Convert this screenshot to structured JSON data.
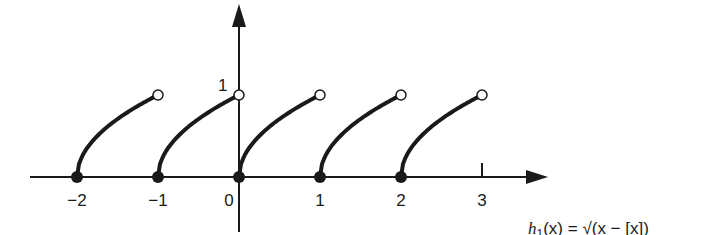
{
  "chart_data": {
    "type": "line",
    "title": "",
    "xlabel": "",
    "ylabel": "",
    "caption": "h1(x) = √(x − [x])",
    "x_ticks": [
      "-2",
      "-1",
      "0",
      "1",
      "2",
      "3"
    ],
    "y_ticks": [
      "1"
    ],
    "xlim": [
      -2.5,
      3.8
    ],
    "ylim": [
      -0.7,
      2.1
    ],
    "grid": false,
    "legend": "none",
    "series": [
      {
        "name": "segment [-2,-1)",
        "x": [
          -2,
          -1.75,
          -1.5,
          -1.25,
          -1
        ],
        "y": [
          0,
          0.5,
          0.707,
          0.866,
          1
        ],
        "start": "closed",
        "end": "open"
      },
      {
        "name": "segment [-1,0)",
        "x": [
          -1,
          -0.75,
          -0.5,
          -0.25,
          0
        ],
        "y": [
          0,
          0.5,
          0.707,
          0.866,
          1
        ],
        "start": "closed",
        "end": "open"
      },
      {
        "name": "segment [0,1)",
        "x": [
          0,
          0.25,
          0.5,
          0.75,
          1
        ],
        "y": [
          0,
          0.5,
          0.707,
          0.866,
          1
        ],
        "start": "closed",
        "end": "open"
      },
      {
        "name": "segment [1,2)",
        "x": [
          1,
          1.25,
          1.5,
          1.75,
          2
        ],
        "y": [
          0,
          0.5,
          0.707,
          0.866,
          1
        ],
        "start": "closed",
        "end": "open"
      },
      {
        "name": "segment [2,3)",
        "x": [
          2,
          2.25,
          2.5,
          2.75,
          3
        ],
        "y": [
          0,
          0.5,
          0.707,
          0.866,
          1
        ],
        "start": "closed",
        "end": "open"
      }
    ]
  },
  "labels": {
    "x_ticks": [
      "−2",
      "−1",
      "0",
      "1",
      "2",
      "3"
    ],
    "y_one": "1",
    "caption_fn": "h",
    "caption_sub": "1",
    "caption_rest": "(x) = √(x − [x])"
  }
}
